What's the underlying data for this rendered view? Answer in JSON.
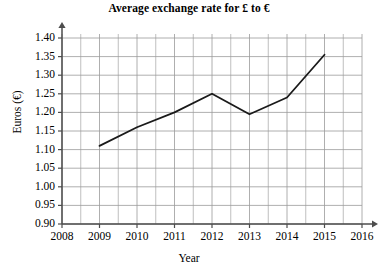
{
  "chart_data": {
    "type": "line",
    "title": "Average exchange rate for £ to €",
    "xlabel": "Year",
    "ylabel": "Euros (€)",
    "xlim": [
      2008,
      2016
    ],
    "ylim": [
      0.9,
      1.4
    ],
    "grid": true,
    "legend": null,
    "x": [
      2009,
      2010,
      2011,
      2012,
      2013,
      2014,
      2015
    ],
    "values": [
      1.11,
      1.16,
      1.2,
      1.25,
      1.195,
      1.24,
      1.355
    ],
    "series": [
      {
        "name": "Average exchange rate",
        "x": [
          2009,
          2010,
          2011,
          2012,
          2013,
          2014,
          2015
        ],
        "values": [
          1.11,
          1.16,
          1.2,
          1.25,
          1.195,
          1.24,
          1.355
        ]
      }
    ],
    "y_ticks": [
      "0.90",
      "0.95",
      "1.00",
      "1.05",
      "1.10",
      "1.15",
      "1.20",
      "1.25",
      "1.30",
      "1.35",
      "1.40"
    ],
    "x_ticks": [
      "2008",
      "2009",
      "2010",
      "2011",
      "2012",
      "2013",
      "2014",
      "2015",
      "2016"
    ],
    "minor_grid_x_step": 0.5,
    "minor_grid_y_step": 0.05,
    "line_color": "#1a1a1a",
    "grid_color": "#9a9a9a",
    "axis_color": "#4d4d4d",
    "background_color": "#ffffff"
  }
}
